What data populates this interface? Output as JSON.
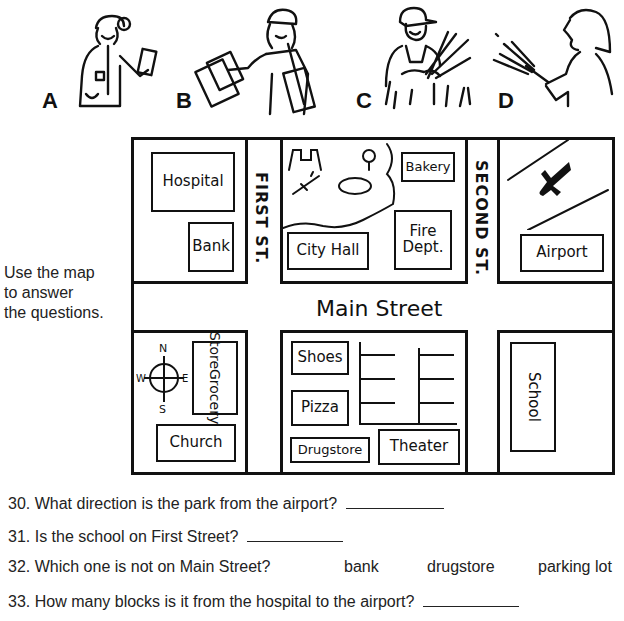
{
  "figures": [
    {
      "letter": "A",
      "depicts": "doctor with clipboard"
    },
    {
      "letter": "B",
      "depicts": "mail carrier with letters"
    },
    {
      "letter": "C",
      "depicts": "farmer with wheat"
    },
    {
      "letter": "D",
      "depicts": "firefighter with hose"
    }
  ],
  "instructions": [
    "Use the map",
    "to answer",
    "the questions."
  ],
  "map": {
    "streets": {
      "first": "FIRST ST.",
      "second": "SECOND ST.",
      "main": "Main Street"
    },
    "buildings": {
      "hospital": "Hospital",
      "bank": "Bank",
      "city_hall": "City Hall",
      "bakery": "Bakery",
      "fire_dept_line1": "Fire",
      "fire_dept_line2": "Dept.",
      "airport": "Airport",
      "grocery_line1": "Grocery",
      "grocery_line2": "Store",
      "church": "Church",
      "shoes": "Shoes",
      "pizza": "Pizza",
      "drugstore": "Drugstore",
      "theater": "Theater",
      "school": "School"
    },
    "compass": {
      "n": "N",
      "s": "S",
      "e": "E",
      "w": "W"
    }
  },
  "questions": [
    {
      "number": "30.",
      "text": "What direction is the park from the airport?"
    },
    {
      "number": "31.",
      "text": "Is the school on First Street?"
    },
    {
      "number": "32.",
      "text": "Which one is not on Main Street?",
      "choices": [
        "bank",
        "drugstore",
        "parking lot"
      ]
    },
    {
      "number": "33.",
      "text": "How many blocks is it from the hospital to the airport?"
    }
  ]
}
